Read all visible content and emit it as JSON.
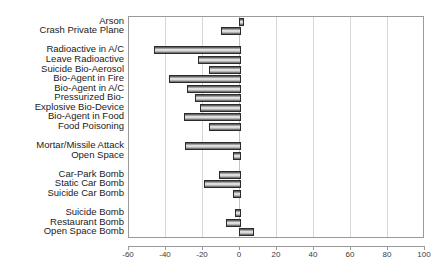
{
  "chart_data": {
    "type": "bar",
    "orientation": "horizontal",
    "title": "",
    "subtitle": "",
    "xlabel": "",
    "ylabel": "",
    "xlim": [
      -60,
      100
    ],
    "xticks": [
      -60,
      -40,
      -20,
      0,
      20,
      40,
      60,
      80,
      100
    ],
    "xticklabels": [
      "-60",
      "-40",
      "-20",
      "0",
      "20",
      "40",
      "60",
      "80",
      "100"
    ],
    "grid": true,
    "gridlines_at": [
      -60,
      -40,
      -20,
      0,
      20,
      40,
      60,
      80,
      100
    ],
    "legend": [],
    "annotations": [],
    "categories": [
      "Arson",
      "Crash Private Plane",
      "",
      "Radioactive in A/C",
      "Leave Radioactive",
      "Suicide Bio-Aerosol",
      "Bio-Agent in Fire",
      "Bio-Agent in A/C",
      "Pressurized Bio-",
      "Explosive Bio-Device",
      "Bio-Agent in Food",
      "Food Poisoning",
      "",
      "Mortar/Missile Attack",
      "Open Space",
      "",
      "Car-Park Bomb",
      "Static Car Bomb",
      "Suicide Car Bomb",
      "",
      "Suicide Bomb",
      "Restaurant Bomb",
      "Open Space Bomb"
    ],
    "values": [
      1,
      -9.5,
      null,
      -46,
      -22,
      -16,
      -38,
      -28,
      -24,
      -21,
      -30,
      -16,
      null,
      -29,
      -3,
      null,
      -11,
      -19,
      -3,
      null,
      -2,
      -7,
      7
    ]
  }
}
